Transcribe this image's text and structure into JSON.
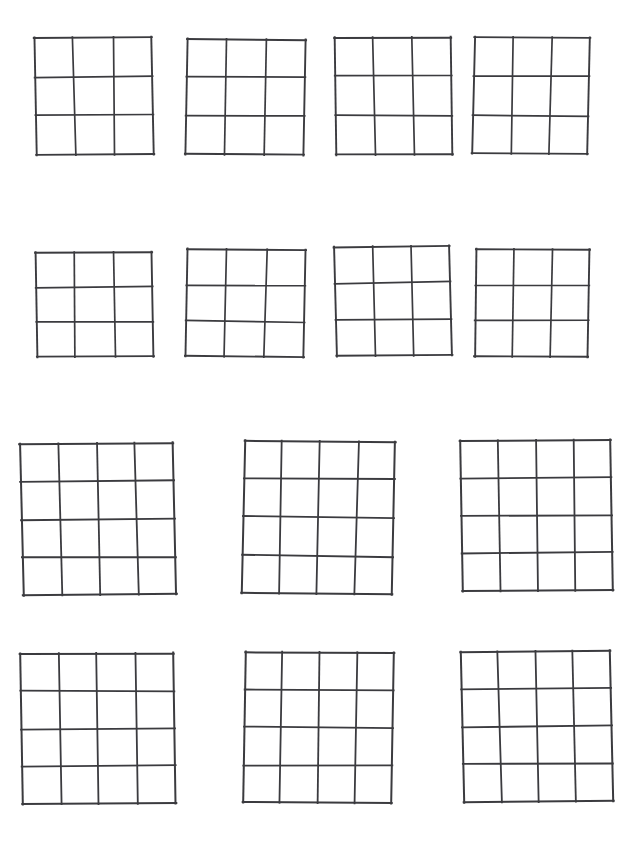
{
  "page": {
    "width": 642,
    "height": 843,
    "background_color": "#ffffff",
    "ink_color": "#3b3b3f"
  },
  "legend": {
    "row_1_label": "Row 1 — four 3x3 grids",
    "row_2_label": "Row 2 — four 3x3 grids",
    "row_3_label": "Row 3 — three 4x4 grids",
    "row_4_label": "Row 4 — three 4x4 grids"
  },
  "rows": [
    {
      "index": 1,
      "grid_count": 4,
      "grid_size": "3x3"
    },
    {
      "index": 2,
      "grid_count": 4,
      "grid_size": "3x3"
    },
    {
      "index": 3,
      "grid_count": 3,
      "grid_size": "4x4"
    },
    {
      "index": 4,
      "grid_count": 3,
      "grid_size": "4x4"
    }
  ],
  "grids": [
    {
      "id": "grid-r1-c1",
      "row": 1,
      "col": 1,
      "rows": 3,
      "cols": 3,
      "x": 35,
      "y": 37,
      "width": 118,
      "height": 118,
      "rotation": -0.4,
      "skew_x": 0.8,
      "stroke_width": 1.7,
      "cells": [
        [
          "",
          "",
          ""
        ],
        [
          "",
          "",
          ""
        ],
        [
          "",
          "",
          ""
        ]
      ]
    },
    {
      "id": "grid-r1-c2",
      "row": 1,
      "col": 2,
      "rows": 3,
      "cols": 3,
      "x": 186,
      "y": 39,
      "width": 119,
      "height": 116,
      "rotation": 0.5,
      "skew_x": -0.6,
      "stroke_width": 1.7,
      "cells": [
        [
          "",
          "",
          ""
        ],
        [
          "",
          "",
          ""
        ],
        [
          "",
          "",
          ""
        ]
      ]
    },
    {
      "id": "grid-r1-c3",
      "row": 1,
      "col": 3,
      "rows": 3,
      "cols": 3,
      "x": 335,
      "y": 37,
      "width": 117,
      "height": 118,
      "rotation": -0.3,
      "skew_x": 0.5,
      "stroke_width": 1.7,
      "cells": [
        [
          "",
          "",
          ""
        ],
        [
          "",
          "",
          ""
        ],
        [
          "",
          "",
          ""
        ]
      ]
    },
    {
      "id": "grid-r1-c4",
      "row": 1,
      "col": 4,
      "rows": 3,
      "cols": 3,
      "x": 473,
      "y": 37,
      "width": 116,
      "height": 117,
      "rotation": 0.4,
      "skew_x": -0.9,
      "stroke_width": 1.7,
      "cells": [
        [
          "",
          "",
          ""
        ],
        [
          "",
          "",
          ""
        ],
        [
          "",
          "",
          ""
        ]
      ]
    },
    {
      "id": "grid-r2-c1",
      "row": 2,
      "col": 1,
      "rows": 3,
      "cols": 3,
      "x": 36,
      "y": 252,
      "width": 117,
      "height": 105,
      "rotation": -0.3,
      "skew_x": 0.7,
      "stroke_width": 1.7,
      "cells": [
        [
          "",
          "",
          ""
        ],
        [
          "",
          "",
          ""
        ],
        [
          "",
          "",
          ""
        ]
      ]
    },
    {
      "id": "grid-r2-c2",
      "row": 2,
      "col": 2,
      "rows": 3,
      "cols": 3,
      "x": 186,
      "y": 249,
      "width": 119,
      "height": 108,
      "rotation": 0.6,
      "skew_x": -0.5,
      "stroke_width": 1.7,
      "cells": [
        [
          "",
          "",
          ""
        ],
        [
          "",
          "",
          ""
        ],
        [
          "",
          "",
          ""
        ]
      ]
    },
    {
      "id": "grid-r2-c3",
      "row": 2,
      "col": 3,
      "rows": 3,
      "cols": 3,
      "x": 335,
      "y": 246,
      "width": 116,
      "height": 110,
      "rotation": -0.6,
      "skew_x": 0.9,
      "stroke_width": 1.7,
      "cells": [
        [
          "",
          "",
          ""
        ],
        [
          "",
          "",
          ""
        ],
        [
          "",
          "",
          ""
        ]
      ]
    },
    {
      "id": "grid-r2-c4",
      "row": 2,
      "col": 4,
      "rows": 3,
      "cols": 3,
      "x": 475,
      "y": 249,
      "width": 114,
      "height": 108,
      "rotation": 0.3,
      "skew_x": -0.7,
      "stroke_width": 1.7,
      "cells": [
        [
          "",
          "",
          ""
        ],
        [
          "",
          "",
          ""
        ],
        [
          "",
          "",
          ""
        ]
      ]
    },
    {
      "id": "grid-r3-c1",
      "row": 3,
      "col": 1,
      "rows": 4,
      "cols": 4,
      "x": 21,
      "y": 443,
      "width": 154,
      "height": 152,
      "rotation": -0.5,
      "skew_x": 0.9,
      "stroke_width": 1.8,
      "cells": [
        [
          "",
          "",
          "",
          ""
        ],
        [
          "",
          "",
          "",
          ""
        ],
        [
          "",
          "",
          "",
          ""
        ],
        [
          "",
          "",
          "",
          ""
        ]
      ]
    },
    {
      "id": "grid-r3-c2",
      "row": 3,
      "col": 2,
      "rows": 4,
      "cols": 4,
      "x": 243,
      "y": 441,
      "width": 151,
      "height": 153,
      "rotation": 0.5,
      "skew_x": -0.8,
      "stroke_width": 1.8,
      "cells": [
        [
          "",
          "",
          "",
          ""
        ],
        [
          "",
          "",
          "",
          ""
        ],
        [
          "",
          "",
          "",
          ""
        ],
        [
          "",
          "",
          "",
          ""
        ]
      ]
    },
    {
      "id": "grid-r3-c3",
      "row": 3,
      "col": 3,
      "rows": 4,
      "cols": 4,
      "x": 461,
      "y": 440,
      "width": 151,
      "height": 151,
      "rotation": -0.4,
      "skew_x": 0.6,
      "stroke_width": 1.8,
      "cells": [
        [
          "",
          "",
          "",
          ""
        ],
        [
          "",
          "",
          "",
          ""
        ],
        [
          "",
          "",
          "",
          ""
        ],
        [
          "",
          "",
          "",
          ""
        ]
      ]
    },
    {
      "id": "grid-r4-c1",
      "row": 4,
      "col": 1,
      "rows": 4,
      "cols": 4,
      "x": 21,
      "y": 653,
      "width": 154,
      "height": 151,
      "rotation": -0.3,
      "skew_x": 0.7,
      "stroke_width": 1.8,
      "cells": [
        [
          "",
          "",
          "",
          ""
        ],
        [
          "",
          "",
          "",
          ""
        ],
        [
          "",
          "",
          "",
          ""
        ],
        [
          "",
          "",
          "",
          ""
        ]
      ]
    },
    {
      "id": "grid-r4-c2",
      "row": 4,
      "col": 2,
      "rows": 4,
      "cols": 4,
      "x": 244,
      "y": 652,
      "width": 149,
      "height": 151,
      "rotation": 0.4,
      "skew_x": -0.6,
      "stroke_width": 1.8,
      "cells": [
        [
          "",
          "",
          "",
          ""
        ],
        [
          "",
          "",
          "",
          ""
        ],
        [
          "",
          "",
          "",
          ""
        ],
        [
          "",
          "",
          "",
          ""
        ]
      ]
    },
    {
      "id": "grid-r4-c3",
      "row": 4,
      "col": 3,
      "rows": 4,
      "cols": 4,
      "x": 462,
      "y": 651,
      "width": 150,
      "height": 151,
      "rotation": -0.5,
      "skew_x": 0.8,
      "stroke_width": 1.8,
      "cells": [
        [
          "",
          "",
          "",
          ""
        ],
        [
          "",
          "",
          "",
          ""
        ],
        [
          "",
          "",
          "",
          ""
        ],
        [
          "",
          "",
          "",
          ""
        ]
      ]
    }
  ]
}
